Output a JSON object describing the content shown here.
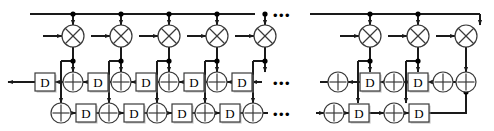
{
  "diagram": {
    "name": "systolic-filter-array",
    "type": "signal-flow-block-diagram",
    "width": 494,
    "height": 131,
    "colors": {
      "line": "#1a1a1a",
      "node": "#000000",
      "box_fill": "#ffffff",
      "box_stroke": "#3a3a3a",
      "background": "#ffffff",
      "shadow": "#9a9a9a"
    },
    "rows": {
      "bus_y": 14,
      "mult_y": 36,
      "tap_y": 61,
      "mid_y": 82,
      "bot_y": 113
    },
    "labels": {
      "delay": "D",
      "adder": "+",
      "multiplier": "x",
      "ellipsis": "•••"
    },
    "geometry": {
      "stage_pitch": 48,
      "left_stage_x": [
        73,
        121,
        169,
        217
      ],
      "right_stage_x": [
        370,
        418,
        466
      ],
      "bus_start_x": 30,
      "bus_gap": [
        255,
        310
      ],
      "box_w": 20,
      "box_h": 18,
      "adder_r": 10,
      "mult_r": 11,
      "dot_r": 2.6
    },
    "ellipses": [
      {
        "name": "ellipsis-top",
        "x": 282,
        "y": 16
      },
      {
        "name": "ellipsis-middle",
        "x": 282,
        "y": 84
      },
      {
        "name": "ellipsis-bottom",
        "x": 282,
        "y": 115
      }
    ],
    "elements": {
      "multipliers": [
        {
          "name": "multiplier-1",
          "x": 73,
          "y": 36
        },
        {
          "name": "multiplier-2",
          "x": 121,
          "y": 36
        },
        {
          "name": "multiplier-3",
          "x": 169,
          "y": 36
        },
        {
          "name": "multiplier-4",
          "x": 217,
          "y": 36
        },
        {
          "name": "multiplier-5",
          "x": 265,
          "y": 36
        },
        {
          "name": "multiplier-6",
          "x": 370,
          "y": 36
        },
        {
          "name": "multiplier-7",
          "x": 418,
          "y": 36
        },
        {
          "name": "multiplier-8",
          "x": 466,
          "y": 36
        }
      ],
      "middle_row": [
        {
          "name": "delay-mid-1",
          "kind": "delay",
          "x": 45,
          "y": 82
        },
        {
          "name": "adder-mid-1",
          "kind": "adder",
          "x": 73,
          "y": 82
        },
        {
          "name": "delay-mid-2",
          "kind": "delay",
          "x": 98,
          "y": 82
        },
        {
          "name": "adder-mid-2",
          "kind": "adder",
          "x": 121,
          "y": 82
        },
        {
          "name": "delay-mid-3",
          "kind": "delay",
          "x": 146,
          "y": 82
        },
        {
          "name": "adder-mid-3",
          "kind": "adder",
          "x": 169,
          "y": 82
        },
        {
          "name": "delay-mid-4",
          "kind": "delay",
          "x": 194,
          "y": 82
        },
        {
          "name": "adder-mid-4",
          "kind": "adder",
          "x": 217,
          "y": 82
        },
        {
          "name": "delay-mid-5",
          "kind": "delay",
          "x": 242,
          "y": 82
        },
        {
          "name": "adder-mid-5",
          "kind": "adder",
          "x": 338,
          "y": 82
        },
        {
          "name": "delay-mid-6",
          "kind": "delay",
          "x": 370,
          "y": 82
        },
        {
          "name": "adder-mid-6",
          "kind": "adder",
          "x": 394,
          "y": 82
        },
        {
          "name": "delay-mid-7",
          "kind": "delay",
          "x": 418,
          "y": 82
        },
        {
          "name": "adder-mid-7",
          "kind": "adder",
          "x": 443,
          "y": 82
        }
      ],
      "bottom_row": [
        {
          "name": "adder-bot-1",
          "kind": "adder",
          "x": 61,
          "y": 113
        },
        {
          "name": "delay-bot-1",
          "kind": "delay",
          "x": 86,
          "y": 113
        },
        {
          "name": "adder-bot-2",
          "kind": "adder",
          "x": 109,
          "y": 113
        },
        {
          "name": "delay-bot-2",
          "kind": "delay",
          "x": 134,
          "y": 113
        },
        {
          "name": "adder-bot-3",
          "kind": "adder",
          "x": 157,
          "y": 113
        },
        {
          "name": "delay-bot-3",
          "kind": "delay",
          "x": 182,
          "y": 113
        },
        {
          "name": "adder-bot-4",
          "kind": "adder",
          "x": 205,
          "y": 113
        },
        {
          "name": "delay-bot-4",
          "kind": "delay",
          "x": 230,
          "y": 113
        },
        {
          "name": "adder-bot-5",
          "kind": "adder",
          "x": 253,
          "y": 113
        },
        {
          "name": "adder-bot-6",
          "kind": "adder",
          "x": 334,
          "y": 113
        },
        {
          "name": "delay-bot-5",
          "kind": "delay",
          "x": 359,
          "y": 113
        },
        {
          "name": "adder-bot-7",
          "kind": "adder",
          "x": 394,
          "y": 113
        },
        {
          "name": "delay-bot-6",
          "kind": "delay",
          "x": 419,
          "y": 113
        }
      ]
    }
  }
}
